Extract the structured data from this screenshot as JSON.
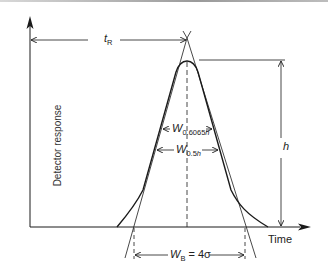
{
  "diagram": {
    "title": "",
    "axes": {
      "y_label": "Detector response",
      "x_label": "Time"
    },
    "labels": {
      "retention_time": {
        "main": "t",
        "sub": "R"
      },
      "height": "h",
      "w_inflection": {
        "main": "W",
        "sub": "0.6065",
        "sub_var": "h"
      },
      "w_half": {
        "main": "W",
        "sub": "0.5",
        "sub_var": "h"
      },
      "w_base": {
        "main": "W",
        "sub": "B",
        "rest": " = 4σ"
      }
    },
    "colors": {
      "line": "#1a1a1a",
      "text": "#222222",
      "background": "#ffffff"
    }
  }
}
